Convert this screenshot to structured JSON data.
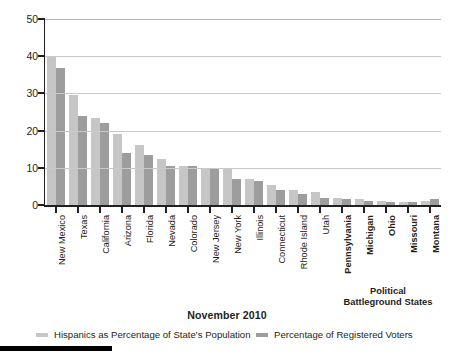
{
  "chart_data": {
    "type": "bar",
    "title": "November 2010",
    "xlabel": "",
    "ylabel": "",
    "ylim": [
      0,
      50
    ],
    "yticks": [
      0,
      10,
      20,
      30,
      40,
      50
    ],
    "grid": true,
    "legend_position": "bottom",
    "categories": [
      "New Mexico",
      "Texas",
      "California",
      "Arizona",
      "Florida",
      "Nevada",
      "Colorado",
      "New Jersey",
      "New York",
      "Illinois",
      "Connecticut",
      "Rhode Island",
      "Utah",
      "Pennsylvania",
      "Michigan",
      "Ohio",
      "Missouri",
      "Montana"
    ],
    "bold_categories": [
      "Pennsylvania",
      "Michigan",
      "Ohio",
      "Missouri",
      "Montana"
    ],
    "series": [
      {
        "name": "Hispanics as Percentage of State's Population",
        "color": "#c6c6c6",
        "values": [
          40,
          29.5,
          23.5,
          19,
          16,
          12.5,
          10.5,
          10,
          10,
          7,
          5.5,
          4,
          3.5,
          2,
          1.5,
          1,
          0.8,
          1
        ]
      },
      {
        "name": "Percentage of Registered Voters",
        "color": "#9d9d9d",
        "values": [
          36.8,
          24,
          22,
          14,
          13.5,
          10.5,
          10.5,
          10,
          7,
          6.5,
          4,
          3,
          2,
          1.5,
          1,
          0.8,
          0.7,
          1.5
        ]
      }
    ],
    "annotation": {
      "line1": "Political",
      "line2": "Battleground States"
    }
  },
  "accent_colors": {
    "series1": "#c6c6c6",
    "series2": "#9d9d9d",
    "axis": "#231f20",
    "grid": "#c9c9c9",
    "background": "#ffffff"
  }
}
